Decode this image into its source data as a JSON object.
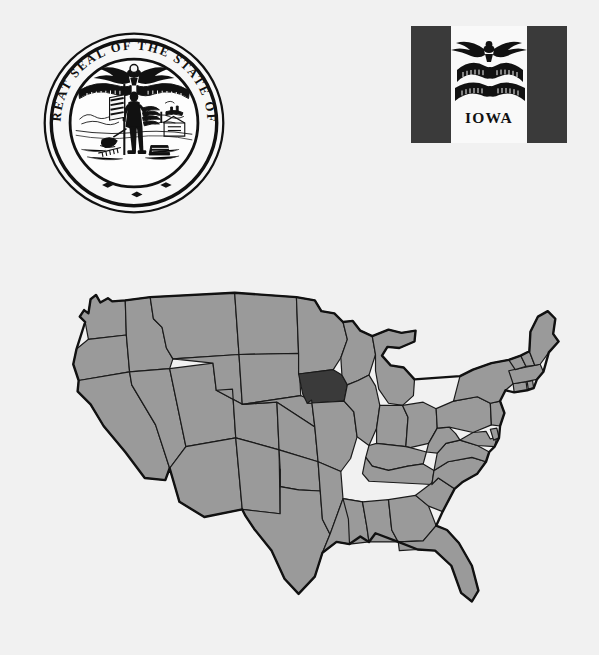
{
  "page": {
    "background_color": "#f1f1f1",
    "subject_state": "Iowa"
  },
  "seal": {
    "name": "great-seal-of-iowa",
    "legend_text": "THE GREAT SEAL OF THE STATE OF IOWA",
    "legend_letters": "THE GREAT SEAL OF THE STATE OF IOWA",
    "ink_color": "#111111",
    "field_color": "#f7f7f7",
    "elements": [
      "eagle-with-ribbon",
      "citizen-soldier",
      "american-flag",
      "plow",
      "wheat-sheaf",
      "anvil",
      "steamboat",
      "cabin",
      "river-landscape"
    ]
  },
  "flag": {
    "name": "flag-of-iowa",
    "label": "IOWA",
    "hoist_band_color": "#3a3a3a",
    "fly_band_color": "#3a3a3a",
    "center_band_color": "#f9f9f9",
    "emblem_color": "#111111",
    "emblem": "eagle-with-streamer",
    "streamer_motto": "OUR LIBERTIES WE PRIZE AND OUR RIGHTS WE WILL MAINTAIN",
    "bands": [
      {
        "name": "hoist",
        "color": "#3a3a3a"
      },
      {
        "name": "center",
        "color": "#f9f9f9"
      },
      {
        "name": "fly",
        "color": "#3a3a3a"
      }
    ]
  },
  "map": {
    "name": "united-states-locator-map",
    "state_fill": "#9a9a9a",
    "highlight_fill": "#3a3a3a",
    "border_color": "#1a1a1a",
    "outline_color": "#111111",
    "highlighted_state": "Iowa",
    "highlighted_state_abbr": "IA",
    "region": "contiguous United States",
    "states_shown": 48
  }
}
